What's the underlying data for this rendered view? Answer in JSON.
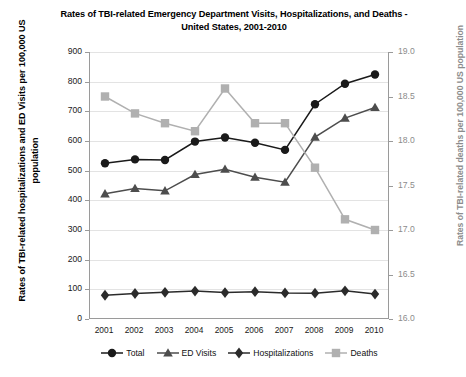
{
  "chart_data": {
    "type": "line",
    "title": "Rates of TBI-related Emergency Department Visits, Hospitalizations, and Deaths - United States, 2001-2010",
    "title_line1": "Rates of TBI-related Emergency Department Visits, Hospitalizations, and Deaths -",
    "title_line2": "United States, 2001-2010",
    "xlabel": "",
    "ylabel": "Rates of TBI-related hospitalizations and ED Visits per 100,000 US population",
    "ylabel_right": "Rates of TBI-related deaths per 100,000 US population",
    "categories": [
      "2001",
      "2002",
      "2003",
      "2004",
      "2005",
      "2006",
      "2007",
      "2008",
      "2009",
      "2010"
    ],
    "ylim": [
      0,
      900
    ],
    "yticks": [
      "900",
      "800",
      "700",
      "600",
      "500",
      "400",
      "300",
      "200",
      "100",
      "0"
    ],
    "ylim_right": [
      16.0,
      19.0
    ],
    "yticks_right": [
      "19.0",
      "18.5",
      "18.0",
      "17.5",
      "17.0",
      "16.5",
      "16.0"
    ],
    "grid": true,
    "legend_position": "bottom",
    "series": [
      {
        "name": "Total",
        "axis": "left",
        "marker": "circle",
        "color": "#1a1a1a",
        "values": [
          525,
          538,
          536,
          598,
          612,
          594,
          570,
          724,
          793,
          824
        ]
      },
      {
        "name": "ED Visits",
        "axis": "left",
        "marker": "triangle",
        "color": "#4d4d4d",
        "values": [
          422,
          440,
          432,
          487,
          505,
          478,
          461,
          613,
          677,
          713
        ]
      },
      {
        "name": "Hospitalizations",
        "axis": "left",
        "marker": "diamond",
        "color": "#2b2b2b",
        "values": [
          80,
          86,
          90,
          94,
          89,
          92,
          88,
          87,
          95,
          84
        ]
      },
      {
        "name": "Deaths",
        "axis": "right",
        "marker": "square",
        "color": "#b0b0b0",
        "values": [
          18.5,
          18.31,
          18.2,
          18.11,
          18.59,
          18.2,
          18.2,
          17.7,
          17.12,
          17.0
        ]
      }
    ]
  },
  "colors": {
    "total": "#1a1a1a",
    "ed_visits": "#4d4d4d",
    "hospitalizations": "#2b2b2b",
    "deaths": "#b0b0b0",
    "grid": "#e3e3e3",
    "axis": "#9a9a9a",
    "right_axis_text": "#8c8c8c"
  }
}
